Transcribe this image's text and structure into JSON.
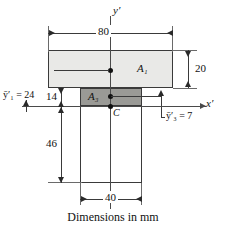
{
  "figure": {
    "caption": "Dimensions in mm",
    "axes": {
      "y_label": "y′",
      "x_label": "x′"
    },
    "regions": [
      {
        "id": "A1",
        "label": "A₁",
        "fill": "#e9e9e7",
        "width_mm": 80,
        "height_mm": 20
      },
      {
        "id": "A3",
        "label": "A₃",
        "fill": "#9a9a96",
        "width_mm": 40,
        "height_mm": 14
      }
    ],
    "centroid": {
      "label": "C"
    },
    "dimensions": [
      {
        "id": "top-width",
        "value": "80"
      },
      {
        "id": "flange-depth",
        "value": "20"
      },
      {
        "id": "overlap-14",
        "value": "14"
      },
      {
        "id": "web-46",
        "value": "46"
      },
      {
        "id": "bottom-width",
        "value": "40"
      }
    ],
    "centroid_labels": [
      {
        "id": "ybar1",
        "text": "ȳ′₁ = 24"
      },
      {
        "id": "ybar3",
        "text": "ȳ′₃ = 7"
      }
    ],
    "colors": {
      "flange": "#e9e9e7",
      "overlap": "#9a9a96",
      "web": "#ffffff",
      "outline": "#3a3a3a",
      "axis": "#4a4a4a"
    }
  }
}
